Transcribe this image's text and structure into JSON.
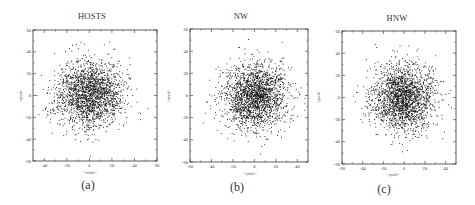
{
  "figure": {
    "panels": [
      {
        "id": "a",
        "title": "HOSTS",
        "sublabel": "(a)",
        "xlabel": "<xtalt>",
        "ylabel": "<ytalt>"
      },
      {
        "id": "b",
        "title": "NW",
        "sublabel": "(b)",
        "xlabel": "<ytalt>",
        "ylabel": "<xtalt>"
      },
      {
        "id": "c",
        "title": "HNW",
        "sublabel": "(c)",
        "xlabel": "<ytalt>",
        "ylabel": "<ytalt>"
      }
    ]
  },
  "chart_data": [
    {
      "type": "scatter",
      "title": "HOSTS",
      "xlabel": "<xtalt>",
      "ylabel": "<ytalt>",
      "xlim": [
        -50,
        60
      ],
      "ylim": [
        -60,
        60
      ],
      "xticks": [
        -40,
        -20,
        0,
        20,
        40,
        60
      ],
      "yticks": [
        -60,
        -40,
        -20,
        0,
        20,
        40,
        60
      ],
      "grid": false,
      "legend": null,
      "distribution": {
        "center": [
          0,
          2
        ],
        "sigma": [
          15,
          15
        ],
        "n_points": 2000
      },
      "marker": {
        "shape": "dot",
        "color": "#111111"
      }
    },
    {
      "type": "scatter",
      "title": "NW",
      "xlabel": "<ytalt>",
      "ylabel": "<xtalt>",
      "xlim": [
        -60,
        50
      ],
      "ylim": [
        -60,
        60
      ],
      "xticks": [
        -60,
        -40,
        -20,
        0,
        20,
        40
      ],
      "yticks": [
        -60,
        -40,
        -20,
        0,
        20,
        40,
        60
      ],
      "grid": false,
      "legend": null,
      "distribution": {
        "center": [
          0,
          0
        ],
        "sigma": [
          15,
          15
        ],
        "n_points": 2000
      },
      "marker": {
        "shape": "dot",
        "color": "#111111"
      }
    },
    {
      "type": "scatter",
      "title": "HNW",
      "xlabel": "<ytalt>",
      "ylabel": "<ytalt>",
      "xlim": [
        -60,
        50
      ],
      "ylim": [
        -60,
        60
      ],
      "xticks": [
        -60,
        -40,
        -20,
        0,
        20,
        40
      ],
      "yticks": [
        -60,
        -40,
        -20,
        0,
        20,
        40,
        60
      ],
      "grid": false,
      "legend": null,
      "distribution": {
        "center": [
          -2,
          0
        ],
        "sigma": [
          15,
          15
        ],
        "n_points": 2000
      },
      "marker": {
        "shape": "dot",
        "color": "#111111"
      }
    }
  ]
}
